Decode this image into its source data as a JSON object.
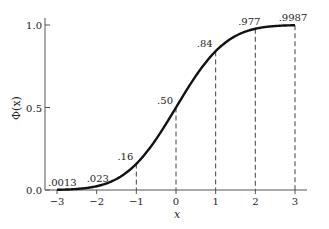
{
  "chart_data": {
    "type": "line",
    "title": "",
    "xlabel": "x",
    "ylabel": "Φ(x)",
    "xlim": [
      -3,
      3
    ],
    "ylim": [
      0,
      1.0
    ],
    "grid": false,
    "legend": null,
    "x_ticks": [
      "−3",
      "−2",
      "−1",
      "0",
      "1",
      "2",
      "3"
    ],
    "y_ticks": [
      "0.0",
      "0.5",
      "1.0"
    ],
    "series": [
      {
        "name": "Standard normal CDF Φ(x)",
        "x": [
          -3,
          -2,
          -1,
          0,
          1,
          2,
          3
        ],
        "values": [
          0.0013,
          0.023,
          0.16,
          0.5,
          0.84,
          0.977,
          0.9987
        ]
      }
    ],
    "annotations": [
      {
        "x": -3,
        "label": ".0013"
      },
      {
        "x": -2,
        "label": ".023"
      },
      {
        "x": -1,
        "label": ".16"
      },
      {
        "x": 0,
        "label": ".50"
      },
      {
        "x": 1,
        "label": ".84"
      },
      {
        "x": 2,
        "label": ".977"
      },
      {
        "x": 3,
        "label": ".9987"
      }
    ],
    "dashed_drop_lines_at": [
      -1,
      0,
      1,
      2,
      3
    ]
  }
}
